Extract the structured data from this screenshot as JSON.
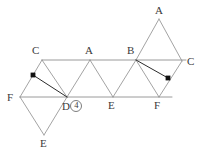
{
  "figure": {
    "kind": "polyhedron-net-diagram",
    "width": 200,
    "height": 159,
    "background": "#ffffff",
    "line_color": "#8c8c8c",
    "rail_color": "#9a9a9a",
    "chord_color": "#2b2b2b",
    "marker_color": "#111111",
    "label_color": "#3a3a3a"
  },
  "labels": {
    "c_left": "C",
    "a_mid": "A",
    "b_mid": "B",
    "a_top": "A",
    "c_right": "C",
    "f_left": "F",
    "d_center": "D",
    "d_badge": "4",
    "e_mid": "E",
    "f_right": "F",
    "e_bottom": "E"
  },
  "geometry": {
    "top_rail": {
      "x1": 42,
      "y1": 60,
      "x2": 186,
      "y2": 60
    },
    "bottom_rail": {
      "x1": 20,
      "y1": 97,
      "x2": 172,
      "y2": 97
    },
    "vertices": {
      "c_left": {
        "x": 42,
        "y": 60
      },
      "a_mid": {
        "x": 90,
        "y": 60
      },
      "b_mid": {
        "x": 136,
        "y": 60
      },
      "c_right": {
        "x": 182,
        "y": 61
      },
      "a_top": {
        "x": 159,
        "y": 19
      },
      "f_left": {
        "x": 20,
        "y": 97
      },
      "d_center": {
        "x": 67,
        "y": 97
      },
      "e_mid": {
        "x": 113,
        "y": 97
      },
      "f_right": {
        "x": 159,
        "y": 97
      },
      "e_bottom": {
        "x": 44,
        "y": 135
      }
    },
    "markers": [
      {
        "name": "marker-left",
        "x": 33,
        "y": 75
      },
      {
        "name": "marker-right",
        "x": 168,
        "y": 78
      }
    ],
    "chords": [
      {
        "name": "chord-left",
        "x1": 33,
        "y1": 75,
        "x2": 67,
        "y2": 97
      },
      {
        "name": "chord-right",
        "x1": 136,
        "y1": 60,
        "x2": 168,
        "y2": 78
      }
    ]
  }
}
